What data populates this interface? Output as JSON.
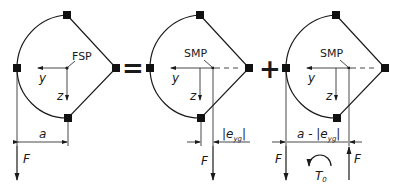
{
  "diagram": {
    "operators": {
      "equals": "=",
      "plus": "+"
    },
    "panels": [
      {
        "id": "original",
        "point_label": "FSP",
        "axis_y": "y",
        "axis_z": "z",
        "dimension_label": "a",
        "force_label": "F"
      },
      {
        "id": "shifted-force",
        "point_label": "SMP",
        "axis_y": "y",
        "axis_z": "z",
        "dimension_label": "|e",
        "dimension_sub": "yg",
        "dimension_close": "|",
        "force_label": "F"
      },
      {
        "id": "force-couple",
        "point_label": "SMP",
        "axis_y": "y",
        "axis_z": "z",
        "dimension_label": "a - |e",
        "dimension_sub": "yg",
        "dimension_close": "|",
        "force_down_label": "F",
        "force_up_label": "F",
        "torque_label": "T",
        "torque_sub": "0"
      }
    ],
    "colors": {
      "line": "#1a1a1a",
      "node": "#111111",
      "background": "#ffffff"
    }
  }
}
